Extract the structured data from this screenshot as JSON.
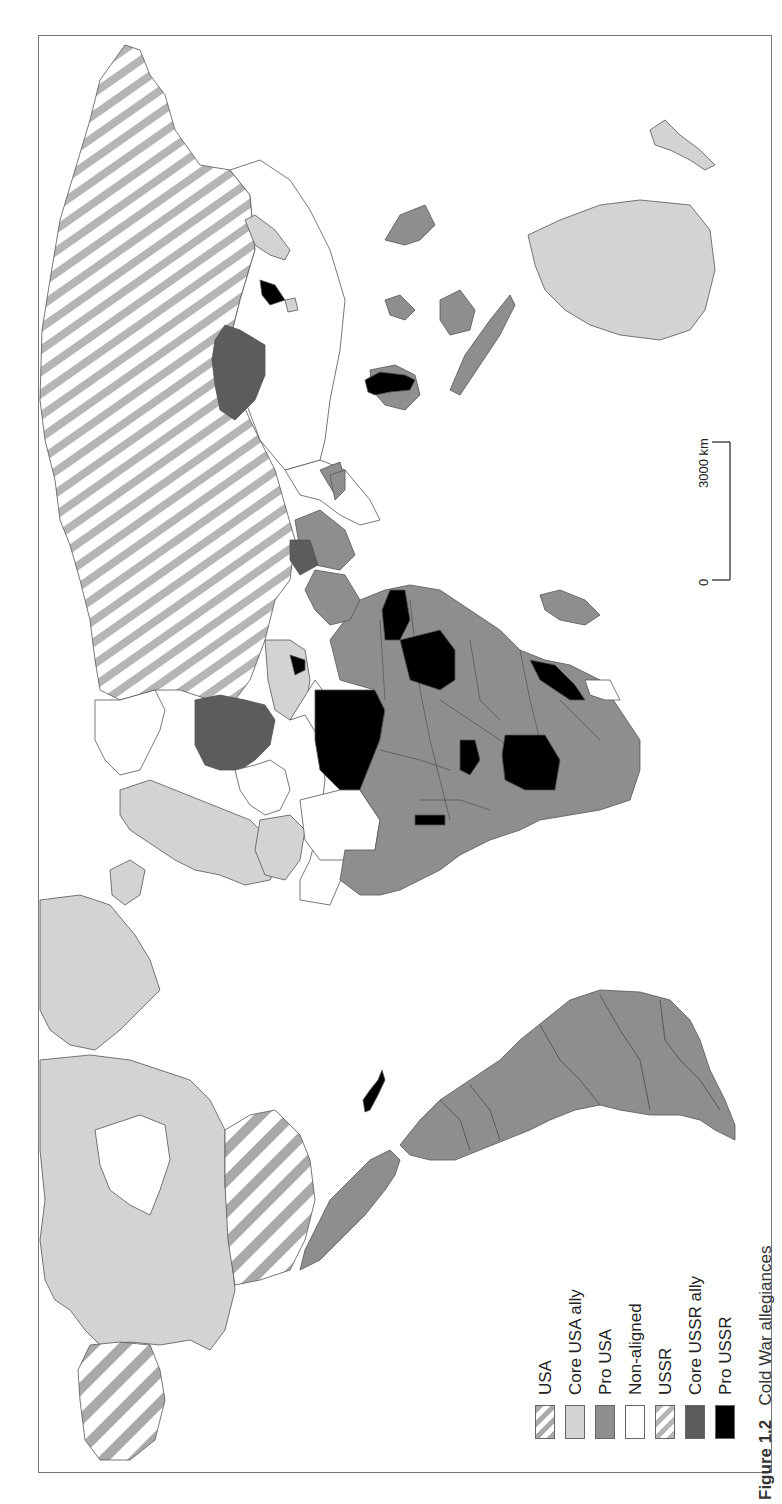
{
  "figure": {
    "caption_number": "Figure 1.2",
    "caption_title": "Cold War allegiances",
    "orientation": "rotated 90° counter-clockwise (north at left)"
  },
  "legend": {
    "items": [
      {
        "label": "USA",
        "style": "hatch",
        "color": "#a9a9a9"
      },
      {
        "label": "Core USA ally",
        "style": "solid",
        "color": "#d3d3d3"
      },
      {
        "label": "Pro USA",
        "style": "solid",
        "color": "#8e8e8e"
      },
      {
        "label": "Non-aligned",
        "style": "solid",
        "color": "#ffffff"
      },
      {
        "label": "USSR",
        "style": "hatch",
        "color": "#b5b5b5"
      },
      {
        "label": "Core USSR ally",
        "style": "solid",
        "color": "#5c5c5c"
      },
      {
        "label": "Pro USSR",
        "style": "solid",
        "color": "#000000"
      }
    ]
  },
  "scale_bar": {
    "start_label": "0",
    "end_label": "3000 km"
  },
  "colors": {
    "usa_hatch": "#a9a9a9",
    "core_usa_ally": "#d3d3d3",
    "pro_usa": "#8e8e8e",
    "non_aligned": "#ffffff",
    "ussr_hatch": "#b5b5b5",
    "core_ussr_ally": "#5c5c5c",
    "pro_ussr": "#000000",
    "outline": "#555555"
  }
}
